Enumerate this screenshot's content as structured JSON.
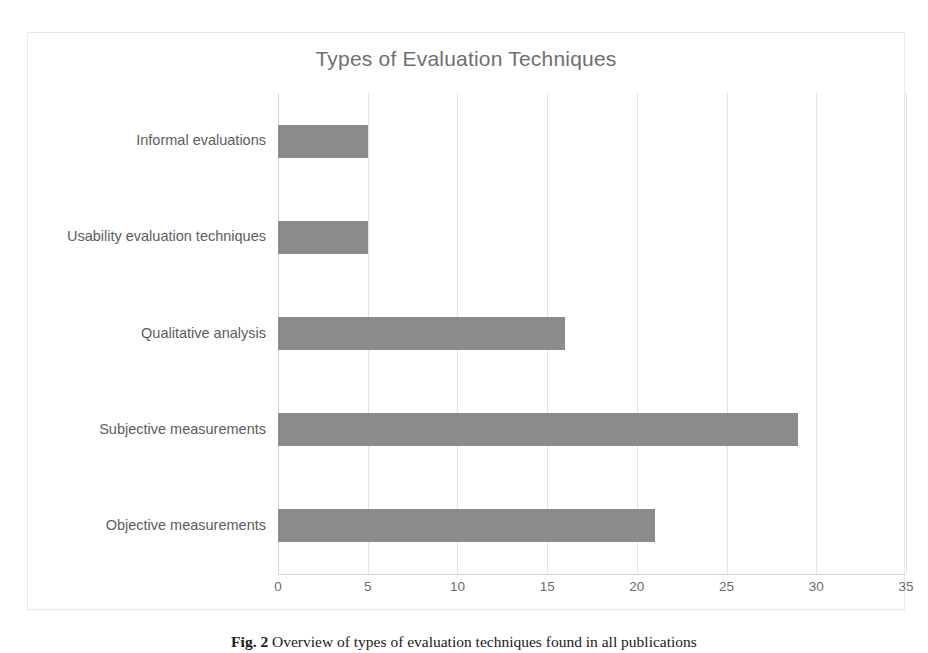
{
  "figure": {
    "caption_label": "Fig. 2",
    "caption_text": "Overview of types of evaluation techniques found in all publications"
  },
  "chart_data": {
    "type": "bar",
    "orientation": "horizontal",
    "title": "Types of Evaluation Techniques",
    "xlabel": "",
    "ylabel": "",
    "xlim": [
      0,
      35
    ],
    "xticks": [
      0,
      5,
      10,
      15,
      20,
      25,
      30,
      35
    ],
    "xtick_labels": [
      "0",
      "5",
      "10",
      "15",
      "20",
      "25",
      "30",
      "35"
    ],
    "grid": true,
    "legend": false,
    "bar_color": "#8b8b8b",
    "title_color": "#6f6f6f",
    "categories": [
      "Informal evaluations",
      "Usability evaluation techniques",
      "Qualitative analysis",
      "Subjective measurements",
      "Objective measurements"
    ],
    "values": [
      5,
      5,
      16,
      29,
      21
    ]
  }
}
